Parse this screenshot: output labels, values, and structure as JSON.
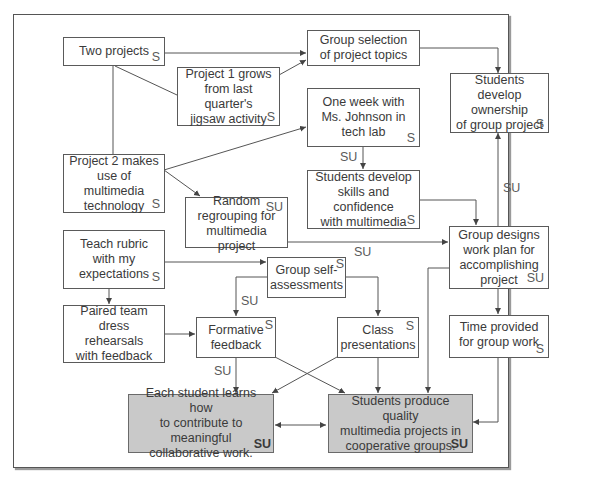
{
  "diagram": {
    "nodes": [
      {
        "id": "two-projects",
        "text": "Two projects",
        "tag": "S"
      },
      {
        "id": "group-selection",
        "text": "Group selection\nof project topics",
        "tag": ""
      },
      {
        "id": "project1",
        "text": "Project 1 grows\nfrom last quarter's\njigsaw activity",
        "tag": "S"
      },
      {
        "id": "ownership",
        "text": "Students develop\nownership\nof group project",
        "tag": "S"
      },
      {
        "id": "one-week",
        "text": "One week with\nMs. Johnson in\ntech lab",
        "tag": "S"
      },
      {
        "id": "project2",
        "text": "Project 2 makes\nuse of multimedia\ntechnology",
        "tag": "S"
      },
      {
        "id": "random-regroup",
        "text": "Random\nregrouping for\nmultimedia project",
        "tag": "SU"
      },
      {
        "id": "skills",
        "text": "Students develop\nskills and confidence\nwith multimedia",
        "tag": "S"
      },
      {
        "id": "teach-rubric",
        "text": "Teach rubric\nwith my\nexpectations",
        "tag": "S"
      },
      {
        "id": "work-plan",
        "text": "Group designs\nwork plan for\naccomplishing\nproject",
        "tag": "SU"
      },
      {
        "id": "self-assess",
        "text": "Group self-\nassessments",
        "tag": "S"
      },
      {
        "id": "paired-team",
        "text": "Paired team\ndress rehearsals\nwith feedback",
        "tag": ""
      },
      {
        "id": "formative",
        "text": "Formative\nfeedback",
        "tag": "S"
      },
      {
        "id": "class-pres",
        "text": "Class\npresentations",
        "tag": "S"
      },
      {
        "id": "time-provided",
        "text": "Time provided\nfor group work",
        "tag": "S"
      },
      {
        "id": "each-student",
        "text": "Each student learns how\nto contribute to meaningful\ncollaborative work.",
        "tag": "SU"
      },
      {
        "id": "quality-projects",
        "text": "Students produce quality\nmultimedia projects in\ncooperative groups.",
        "tag": "SU"
      }
    ],
    "edge_labels": [
      {
        "id": "onweek-skills",
        "text": "SU"
      },
      {
        "id": "workplan-ownership",
        "text": "SU"
      },
      {
        "id": "regroup-workplan",
        "text": "SU"
      },
      {
        "id": "selfassess-formative",
        "text": "SU"
      },
      {
        "id": "formative-each",
        "text": "SU"
      }
    ],
    "colors": {
      "box_border": "#5a5a5a",
      "shaded_fill": "#c9c9c9",
      "line": "#555555",
      "text": "#3a3a3a"
    }
  }
}
